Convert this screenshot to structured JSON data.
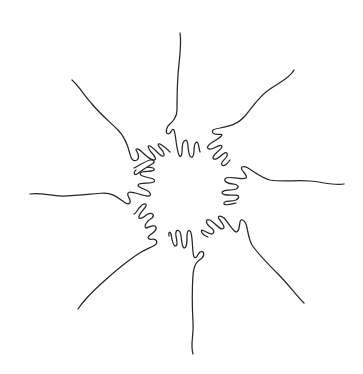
{
  "illustration": {
    "subject": "Eight hands reaching inward forming a circle, single continuous line art",
    "background_color": "#ffffff",
    "stroke_color": "#262626",
    "hand_count": 8,
    "hands": [
      {
        "position": "top",
        "label": "hand-top"
      },
      {
        "position": "upper-right",
        "label": "hand-upper-right"
      },
      {
        "position": "right",
        "label": "hand-right"
      },
      {
        "position": "lower-right",
        "label": "hand-lower-right"
      },
      {
        "position": "bottom",
        "label": "hand-bottom"
      },
      {
        "position": "lower-left",
        "label": "hand-lower-left"
      },
      {
        "position": "left",
        "label": "hand-left"
      },
      {
        "position": "upper-left",
        "label": "hand-upper-left"
      }
    ]
  }
}
